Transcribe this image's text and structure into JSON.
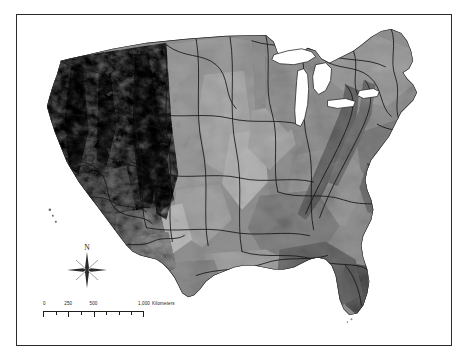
{
  "figure": {
    "type": "map",
    "title": "",
    "palette": "grayscale",
    "background_color": "#ffffff",
    "frame_color": "#2b2b2b",
    "boundary_line_color": "#1a1a1a",
    "water_color": "#ffffff"
  },
  "map": {
    "region_label": "Conterminous United States",
    "projection_hint": "Albers Equal Area Conic",
    "water_bodies": [
      "Lake Superior",
      "Lake Michigan",
      "Lake Huron",
      "Lake Erie",
      "Lake Ontario"
    ],
    "gray_levels": [
      "#f2f2f2",
      "#d8d8d8",
      "#bdbdbd",
      "#a3a3a3",
      "#8a8a8a",
      "#6f6f6f",
      "#575757",
      "#3f3f3f",
      "#2a2a2a"
    ]
  },
  "north_arrow": {
    "label": "N",
    "icon": "compass-star-icon"
  },
  "scalebar": {
    "units_label": "Kilometers",
    "tick_labels": [
      "0",
      "250",
      "500",
      "1,000"
    ],
    "tick_positions_pct": [
      0,
      25,
      50,
      100
    ],
    "minor_divisions": 8,
    "max_value": 1000
  }
}
